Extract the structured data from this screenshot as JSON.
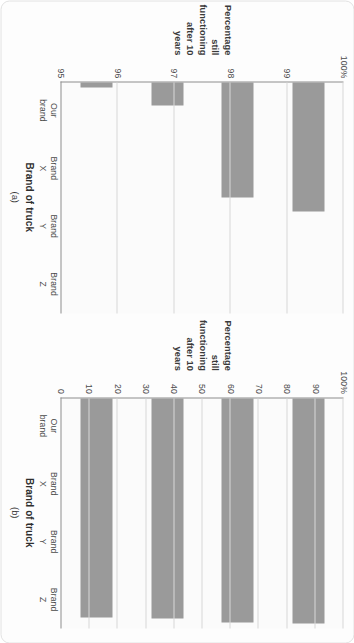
{
  "figure": {
    "orientation": "rotated-90-clockwise",
    "bar_color": "#9a9a9a",
    "axis_color": "#8e8e8e",
    "grid_color": "#d8d8d8",
    "background": "#fbfbfb"
  },
  "panels": [
    {
      "caption": "(a)",
      "ylabel_lines": [
        "Percentage",
        "still functioning",
        "after 10 years"
      ],
      "xaxis_title": "Brand of truck",
      "yticks": [
        "100%",
        "99",
        "98",
        "97",
        "96",
        "95"
      ],
      "categories": [
        [
          "Our",
          "brand"
        ],
        [
          "Brand",
          "X"
        ],
        [
          "Brand",
          "Y"
        ],
        [
          "Brand",
          "Z"
        ]
      ]
    },
    {
      "caption": "(b)",
      "ylabel_lines": [
        "Percentage",
        "still functioning",
        "after 10 years"
      ],
      "xaxis_title": "Brand of truck",
      "yticks": [
        "100%",
        "90",
        "80",
        "70",
        "60",
        "50",
        "40",
        "30",
        "20",
        "10",
        "0"
      ],
      "categories": [
        [
          "Our",
          "brand"
        ],
        [
          "Brand",
          "X"
        ],
        [
          "Brand",
          "Y"
        ],
        [
          "Brand",
          "Z"
        ]
      ]
    }
  ],
  "chart_data": [
    {
      "type": "bar",
      "title": "(a)",
      "categories": [
        "Our brand",
        "Brand X",
        "Brand Y",
        "Brand Z"
      ],
      "values": [
        97.8,
        97.5,
        95.5,
        95.1
      ],
      "xlabel": "Brand of truck",
      "ylabel": "Percentage still functioning after 10 years",
      "ylim": [
        95,
        100
      ],
      "yticks": [
        95,
        96,
        97,
        98,
        99,
        100
      ],
      "ytick_labels": [
        "95",
        "96",
        "97",
        "98",
        "99",
        "100%"
      ],
      "grid": true,
      "legend": "none",
      "note": "truncated value axis exaggerates differences between brands"
    },
    {
      "type": "bar",
      "title": "(b)",
      "categories": [
        "Our brand",
        "Brand X",
        "Brand Y",
        "Brand Z"
      ],
      "values": [
        97.8,
        97.5,
        95.5,
        95.1
      ],
      "xlabel": "Brand of truck",
      "ylabel": "Percentage still functioning after 10 years",
      "ylim": [
        0,
        100
      ],
      "yticks": [
        0,
        10,
        20,
        30,
        40,
        50,
        60,
        70,
        80,
        90,
        100
      ],
      "ytick_labels": [
        "0",
        "10",
        "20",
        "30",
        "40",
        "50",
        "60",
        "70",
        "80",
        "90",
        "100%"
      ],
      "grid": true,
      "legend": "none",
      "note": "full value axis shows the brands are nearly identical"
    }
  ]
}
